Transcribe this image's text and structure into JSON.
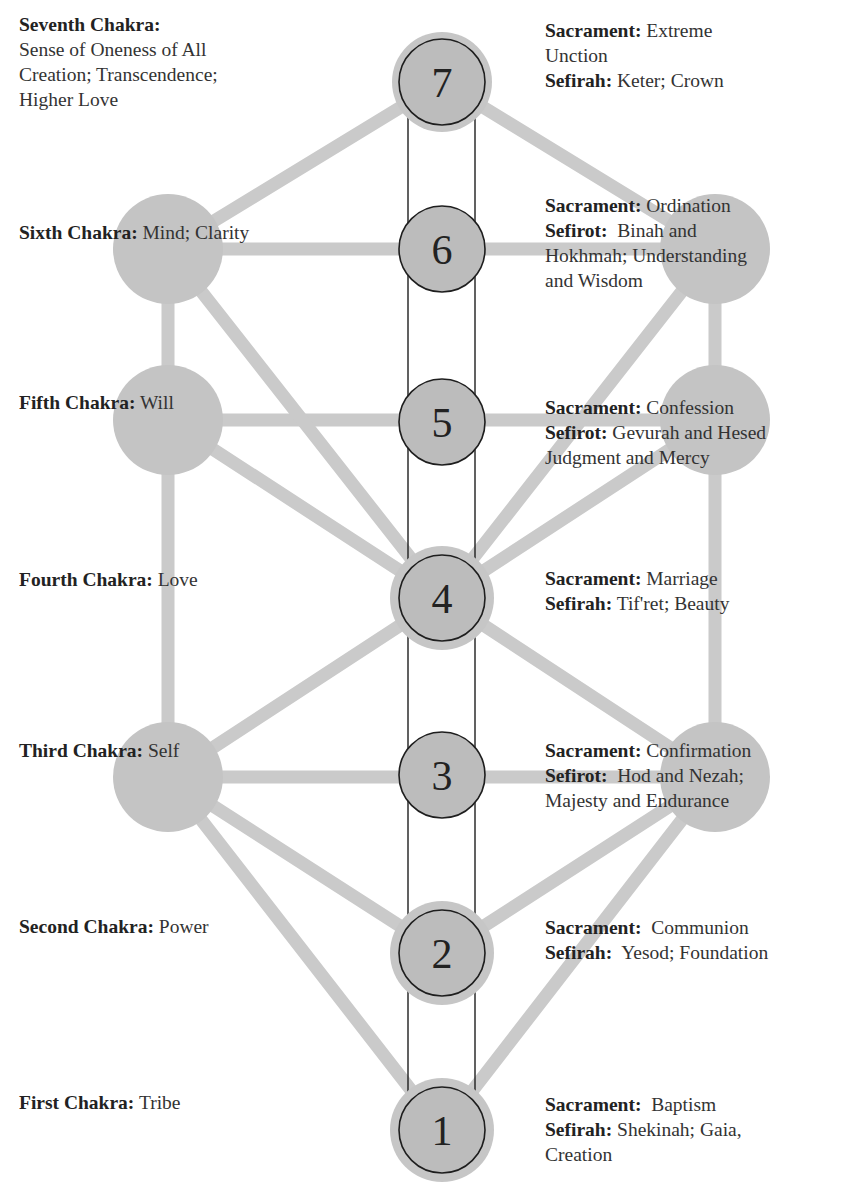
{
  "colors": {
    "node_fill": "#c4c4c4",
    "node_inner": "#bdbdbd",
    "connector": "#cacaca",
    "outline": "#1e1e1e",
    "text": "#333333",
    "background": "#ffffff"
  },
  "center_nodes": [
    {
      "number": "7",
      "cx": 442,
      "cy": 82
    },
    {
      "number": "6",
      "cx": 442,
      "cy": 249
    },
    {
      "number": "5",
      "cx": 442,
      "cy": 422
    },
    {
      "number": "4",
      "cx": 442,
      "cy": 598
    },
    {
      "number": "3",
      "cx": 442,
      "cy": 775
    },
    {
      "number": "2",
      "cx": 442,
      "cy": 953
    },
    {
      "number": "1",
      "cx": 442,
      "cy": 1130
    }
  ],
  "side_nodes": [
    {
      "side": "left",
      "cx": 168,
      "cy": 249
    },
    {
      "side": "left",
      "cx": 168,
      "cy": 420
    },
    {
      "side": "left",
      "cx": 168,
      "cy": 777
    },
    {
      "side": "right",
      "cx": 715,
      "cy": 249
    },
    {
      "side": "right",
      "cx": 715,
      "cy": 420
    },
    {
      "side": "right",
      "cx": 715,
      "cy": 777
    }
  ],
  "chakras": [
    {
      "name": "Seventh Chakra:",
      "lines": [
        "Sense of Oneness of All",
        "Creation; Transcendence;",
        "Higher Love"
      ]
    },
    {
      "name": "Sixth Chakra:",
      "desc": "Mind; Clarity"
    },
    {
      "name": "Fifth Chakra:",
      "desc": "Will"
    },
    {
      "name": "Fourth Chakra:",
      "desc": "Love"
    },
    {
      "name": "Third Chakra:",
      "desc": "Self"
    },
    {
      "name": "Second Chakra:",
      "desc": "Power"
    },
    {
      "name": "First Chakra:",
      "desc": "Tribe"
    }
  ],
  "correspondences": [
    {
      "sacrament_label": "Sacrament:",
      "sacrament": "Extreme",
      "sacrament_cont": "Unction",
      "sefira_label": "Sefirah:",
      "sefira": "Keter; Crown"
    },
    {
      "sacrament_label": "Sacrament:",
      "sacrament": "Ordination",
      "sefira_label": "Sefirot:",
      "sefira": "Binah and",
      "sefira_cont": [
        "Hokhmah; Understanding",
        "and Wisdom"
      ]
    },
    {
      "sacrament_label": "Sacrament:",
      "sacrament": "Confession",
      "sefira_label": "Sefirot:",
      "sefira": "Gevurah and Hesed",
      "sefira_cont": [
        "Judgment and Mercy"
      ]
    },
    {
      "sacrament_label": "Sacrament:",
      "sacrament": "Marriage",
      "sefira_label": "Sefirah:",
      "sefira": "Tif'ret; Beauty"
    },
    {
      "sacrament_label": "Sacrament:",
      "sacrament": "Confirmation",
      "sefira_label": "Sefirot:",
      "sefira": "Hod and Nezah;",
      "sefira_cont": [
        "Majesty and Endurance"
      ]
    },
    {
      "sacrament_label": "Sacrament:",
      "sacrament": "Communion",
      "sefira_label": "Sefirah:",
      "sefira": "Yesod; Foundation"
    },
    {
      "sacrament_label": "Sacrament:",
      "sacrament": "Baptism",
      "sefira_label": "Sefirah:",
      "sefira": "Shekinah; Gaia,",
      "sefira_cont": [
        "Creation"
      ]
    }
  ]
}
